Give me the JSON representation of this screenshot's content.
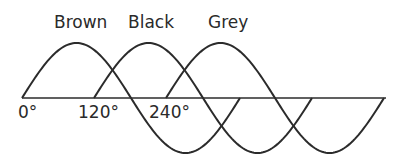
{
  "diagram": {
    "phase_labels": [
      {
        "text": "Brown",
        "x": 54,
        "y": 28
      },
      {
        "text": "Black",
        "x": 128,
        "y": 28
      },
      {
        "text": "Grey",
        "x": 208,
        "y": 28
      }
    ],
    "tick_labels": [
      {
        "text": "0°",
        "x": 18,
        "y": 118
      },
      {
        "text": "120°",
        "x": 78,
        "y": 118
      },
      {
        "text": "240°",
        "x": 149,
        "y": 118
      }
    ],
    "axis": {
      "x1": 22,
      "x2": 386,
      "y": 98
    },
    "waves": [
      {
        "name": "Brown",
        "phase_deg": 0,
        "start_x": 22
      },
      {
        "name": "Black",
        "phase_deg": 120,
        "start_x": 94
      },
      {
        "name": "Grey",
        "phase_deg": 240,
        "start_x": 166
      }
    ],
    "period_px": 218,
    "amplitude_px": 55,
    "stroke_color": "#2b2b2b"
  }
}
